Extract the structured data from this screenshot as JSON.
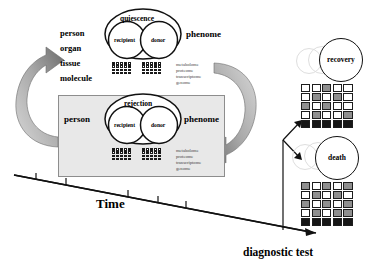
{
  "figure": {
    "title_time": "Time",
    "title_diagnostic": "diagnostic test"
  },
  "tiers": {
    "label": "biological scale tiers",
    "items": [
      "person",
      "organ",
      "tissue",
      "molecule"
    ]
  },
  "omics": {
    "items": [
      "metabolome",
      "proteome",
      "transcriptome",
      "genome"
    ]
  },
  "panels": [
    {
      "name": "quiescence-panel",
      "state": "quiescence",
      "left_label": "person",
      "right_label": "phenome",
      "subjects": [
        "recipient",
        "donor"
      ],
      "shaded": false,
      "omics_labels": [
        "metabolome",
        "proteome",
        "transcriptome",
        "genome"
      ],
      "grids": {
        "recipient": [
          [
            "k",
            "w",
            "w",
            "k",
            "w"
          ],
          [
            "w",
            "g",
            "w",
            "w",
            "k"
          ],
          [
            "w",
            "w",
            "w",
            "w",
            "w"
          ],
          [
            "k",
            "w",
            "k",
            "k",
            "k"
          ]
        ],
        "donor": [
          [
            "k",
            "w",
            "w",
            "k",
            "w"
          ],
          [
            "w",
            "w",
            "w",
            "k",
            "w"
          ],
          [
            "w",
            "w",
            "k",
            "w",
            "w"
          ],
          [
            "k",
            "k",
            "k",
            "w",
            "k"
          ]
        ]
      }
    },
    {
      "name": "rejection-panel",
      "state": "rejection",
      "left_label": "person",
      "right_label": "phenome",
      "subjects": [
        "recipient",
        "donor"
      ],
      "shaded": true,
      "omics_labels": [
        "metabolome",
        "proteome",
        "transcriptome",
        "genome"
      ],
      "grids": {
        "recipient": [
          [
            "k",
            "w",
            "k",
            "w",
            "k"
          ],
          [
            "w",
            "k",
            "w",
            "k",
            "w"
          ],
          [
            "k",
            "w",
            "k",
            "w",
            "k"
          ],
          [
            "w",
            "k",
            "k",
            "k",
            "w"
          ]
        ],
        "donor": [
          [
            "k",
            "w",
            "k",
            "w",
            "w"
          ],
          [
            "w",
            "k",
            "w",
            "w",
            "k"
          ],
          [
            "k",
            "w",
            "k",
            "k",
            "w"
          ],
          [
            "k",
            "k",
            "w",
            "k",
            "k"
          ]
        ]
      }
    }
  ],
  "cycle_arrows": [
    {
      "name": "return-arrow-left",
      "direction": "up-right"
    },
    {
      "name": "progress-arrow-right",
      "direction": "down-left"
    }
  ],
  "time_axis": {
    "label": "Time",
    "tick_count": 5,
    "direction": "descending-left-to-right"
  },
  "branch": {
    "name": "diagnostic-branch",
    "label": "diagnostic test",
    "outcomes": [
      "recovery",
      "death"
    ]
  },
  "outcomes": [
    {
      "name": "recovery",
      "label": "recovery",
      "grid": [
        [
          "w",
          "w",
          "g",
          "w",
          "w"
        ],
        [
          "w",
          "g",
          "w",
          "g",
          "w"
        ],
        [
          "g",
          "w",
          "g",
          "w",
          "w"
        ],
        [
          "w",
          "g",
          "w",
          "w",
          "g"
        ],
        [
          "k",
          "k",
          "k",
          "k",
          "k"
        ]
      ]
    },
    {
      "name": "death",
      "label": "death",
      "grid": [
        [
          "g",
          "w",
          "g",
          "w",
          "g"
        ],
        [
          "w",
          "g",
          "w",
          "g",
          "w"
        ],
        [
          "g",
          "w",
          "g",
          "w",
          "g"
        ],
        [
          "w",
          "g",
          "w",
          "g",
          "g"
        ],
        [
          "k",
          "k",
          "k",
          "k",
          "k"
        ]
      ]
    }
  ],
  "colors": {
    "panel_fill": "#e8e8e8",
    "panel_border": "#8d8d8d",
    "arrow_dark": "#6f6f6f",
    "arrow_light": "#cfcfcf",
    "cell_dark": "#111111",
    "cell_mid": "#8f8f8f",
    "cell_light": "#ffffff",
    "ink": "#000000"
  }
}
